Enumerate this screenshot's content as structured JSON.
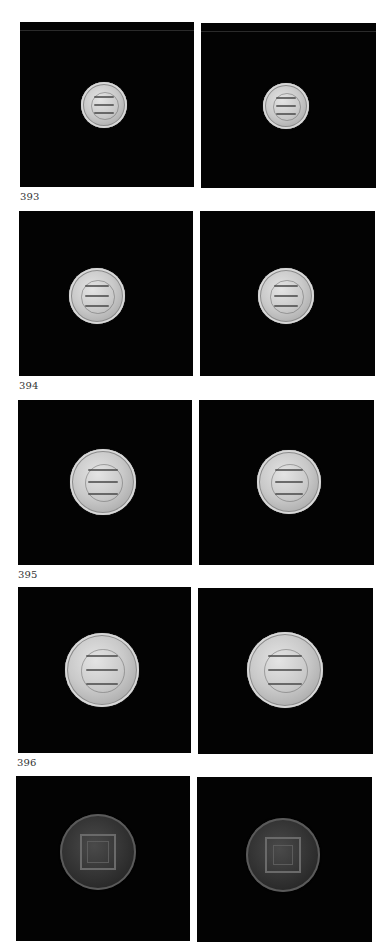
{
  "page": {
    "background": "#ffffff",
    "panel_color": "#030303"
  },
  "plates": [
    {
      "number": "393",
      "label_pos": {
        "x": 20,
        "y": 191
      },
      "obverse": {
        "panel": {
          "x": 20,
          "y": 22,
          "w": 174,
          "h": 165
        },
        "coin": {
          "cx": 104,
          "cy": 105,
          "r": 23,
          "metal": "gold"
        }
      },
      "reverse": {
        "panel": {
          "x": 201,
          "y": 23,
          "w": 175,
          "h": 165
        },
        "coin": {
          "cx": 286,
          "cy": 106,
          "r": 23,
          "metal": "gold"
        }
      }
    },
    {
      "number": "394",
      "label_pos": {
        "x": 19,
        "y": 380
      },
      "obverse": {
        "panel": {
          "x": 19,
          "y": 211,
          "w": 174,
          "h": 165
        },
        "coin": {
          "cx": 97,
          "cy": 296,
          "r": 28,
          "metal": "gold"
        }
      },
      "reverse": {
        "panel": {
          "x": 200,
          "y": 211,
          "w": 175,
          "h": 165
        },
        "coin": {
          "cx": 286,
          "cy": 296,
          "r": 28,
          "metal": "gold"
        }
      }
    },
    {
      "number": "395",
      "label_pos": {
        "x": 18,
        "y": 569
      },
      "obverse": {
        "panel": {
          "x": 18,
          "y": 400,
          "w": 174,
          "h": 165
        },
        "coin": {
          "cx": 103,
          "cy": 482,
          "r": 33,
          "metal": "gold"
        }
      },
      "reverse": {
        "panel": {
          "x": 199,
          "y": 400,
          "w": 175,
          "h": 165
        },
        "coin": {
          "cx": 289,
          "cy": 482,
          "r": 32,
          "metal": "gold"
        }
      }
    },
    {
      "number": "396",
      "label_pos": {
        "x": 17,
        "y": 757
      },
      "obverse": {
        "panel": {
          "x": 18,
          "y": 587,
          "w": 173,
          "h": 166
        },
        "coin": {
          "cx": 102,
          "cy": 670,
          "r": 37,
          "metal": "gold"
        }
      },
      "reverse": {
        "panel": {
          "x": 198,
          "y": 588,
          "w": 175,
          "h": 166
        },
        "coin": {
          "cx": 285,
          "cy": 670,
          "r": 38,
          "metal": "gold"
        }
      }
    },
    {
      "number": "",
      "label_pos": {
        "x": 17,
        "y": 944
      },
      "obverse": {
        "panel": {
          "x": 16,
          "y": 776,
          "w": 174,
          "h": 165
        },
        "coin": {
          "cx": 98,
          "cy": 852,
          "r": 38,
          "metal": "copper"
        }
      },
      "reverse": {
        "panel": {
          "x": 197,
          "y": 777,
          "w": 175,
          "h": 165
        },
        "coin": {
          "cx": 283,
          "cy": 855,
          "r": 37,
          "metal": "copper"
        }
      }
    }
  ]
}
